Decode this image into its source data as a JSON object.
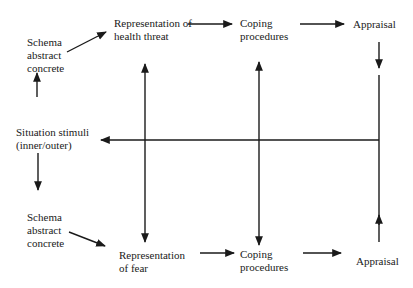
{
  "diagram": {
    "nodes": {
      "schema_top": "Schema\nabstract\nconcrete",
      "rep_health": "Representation of\nhealth threat",
      "coping_top": "Coping\nprocedures",
      "appraisal_top": "Appraisal",
      "situation": "Situation stimuli\n(inner/outer)",
      "schema_bottom": "Schema\nabstract\nconcrete",
      "rep_fear": "Representation\nof fear",
      "coping_bottom": "Coping\nprocedures",
      "appraisal_bottom": "Appraisal"
    },
    "edges": [
      {
        "from": "situation",
        "to": "schema_top"
      },
      {
        "from": "situation",
        "to": "schema_bottom"
      },
      {
        "from": "schema_top",
        "to": "rep_health"
      },
      {
        "from": "schema_bottom",
        "to": "rep_fear"
      },
      {
        "from": "rep_health",
        "to": "coping_top"
      },
      {
        "from": "coping_top",
        "to": "appraisal_top"
      },
      {
        "from": "rep_fear",
        "to": "coping_bottom"
      },
      {
        "from": "coping_bottom",
        "to": "appraisal_bottom"
      },
      {
        "from": "appraisal_top",
        "to": "feedback_line"
      },
      {
        "from": "appraisal_bottom",
        "to": "feedback_line"
      },
      {
        "from": "feedback_line",
        "to": "situation"
      },
      {
        "from": "center_line",
        "to": "rep_health"
      },
      {
        "from": "center_line",
        "to": "rep_fear"
      },
      {
        "from": "center_line",
        "to": "coping_top"
      },
      {
        "from": "center_line",
        "to": "coping_bottom"
      }
    ],
    "colors": {
      "line": "#1a1a1a",
      "background": "#ffffff"
    }
  }
}
